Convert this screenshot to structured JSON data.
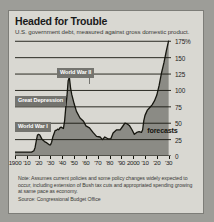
{
  "figure": {
    "title": "Headed for Trouble",
    "subtitle": "U.S. government debt, measured against gross domestic product.",
    "note": "Note: Assumes current policies and some policy changes widely expected to occur, including extension of Bush tax cuts and appropriated spending growing at same pace as economy.",
    "source": "Source: Congressional Budget Office",
    "forecast_label": "forecasts",
    "colors": {
      "panel_background": "#d9d8d2",
      "page_background": "#9d9d98",
      "area_fill": "#8b8b85",
      "line": "#16160f",
      "annotation_badge": "#74746f",
      "gridline": "#16160f",
      "text": "#1a1a1a"
    }
  },
  "chart_data": {
    "type": "area",
    "title": "Headed for Trouble",
    "subtitle": "U.S. government debt, measured against gross domestic product.",
    "xlabel": "",
    "ylabel": "",
    "xlim": [
      1900,
      2032
    ],
    "ylim": [
      0,
      180
    ],
    "grid": true,
    "legend": "none",
    "ytick_labels": [
      "0",
      "25",
      "50",
      "75",
      "100",
      "125",
      "150",
      "175%"
    ],
    "ytick_values": [
      0,
      25,
      50,
      75,
      100,
      125,
      150,
      175
    ],
    "xtick_labels": [
      "1900",
      "'10",
      "'20",
      "'30",
      "'40",
      "'50",
      "'60",
      "'70",
      "'80",
      "'90",
      "2000",
      "'10",
      "'20",
      "'30"
    ],
    "xtick_values": [
      1900,
      1910,
      1920,
      1930,
      1940,
      1950,
      1960,
      1970,
      1980,
      1990,
      2000,
      2010,
      2020,
      2030
    ],
    "series": [
      {
        "name": "Federal debt held by the public as % of GDP",
        "x": [
          1900,
          1905,
          1910,
          1914,
          1916,
          1917,
          1918,
          1919,
          1920,
          1921,
          1923,
          1925,
          1927,
          1929,
          1930,
          1931,
          1932,
          1933,
          1934,
          1935,
          1936,
          1937,
          1938,
          1939,
          1940,
          1941,
          1942,
          1943,
          1944,
          1945,
          1946,
          1947,
          1948,
          1950,
          1952,
          1955,
          1958,
          1960,
          1963,
          1966,
          1969,
          1972,
          1974,
          1976,
          1979,
          1981,
          1983,
          1986,
          1989,
          1991,
          1993,
          1995,
          1997,
          1999,
          2001,
          2003,
          2005,
          2007,
          2008,
          2009,
          2010,
          2012,
          2014,
          2016,
          2018,
          2020,
          2022,
          2024,
          2026,
          2028,
          2030
        ],
        "y": [
          6,
          6,
          6,
          6,
          8,
          13,
          23,
          32,
          33,
          32,
          25,
          22,
          20,
          17,
          17,
          21,
          29,
          34,
          39,
          39,
          41,
          40,
          43,
          44,
          43,
          42,
          54,
          75,
          92,
          115,
          120,
          104,
          94,
          80,
          68,
          58,
          53,
          46,
          43,
          36,
          30,
          29,
          25,
          29,
          26,
          26,
          35,
          40,
          40,
          45,
          50,
          49,
          46,
          40,
          33,
          36,
          37,
          36,
          40,
          54,
          62,
          70,
          74,
          78,
          84,
          93,
          108,
          127,
          142,
          160,
          176
        ]
      }
    ],
    "forecast_start_year": 2010,
    "annotations": [
      {
        "label": "World War I",
        "year": 1918,
        "value": 33
      },
      {
        "label": "Great Depression",
        "year": 1932,
        "value": 40
      },
      {
        "label": "World War II",
        "year": 1945,
        "value": 120
      },
      {
        "label": "forecasts",
        "year": 2016,
        "value": 42
      }
    ]
  }
}
